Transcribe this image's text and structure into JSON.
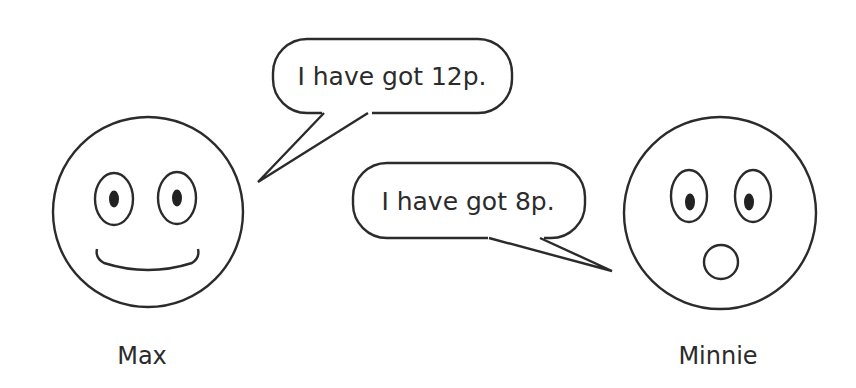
{
  "characters": [
    {
      "name": "Max",
      "expression": "smiling",
      "speech": "I have got 12p."
    },
    {
      "name": "Minnie",
      "expression": "surprised",
      "speech": "I have got 8p."
    }
  ],
  "colors": {
    "line": "#2b2b2b",
    "background": "#ffffff"
  }
}
